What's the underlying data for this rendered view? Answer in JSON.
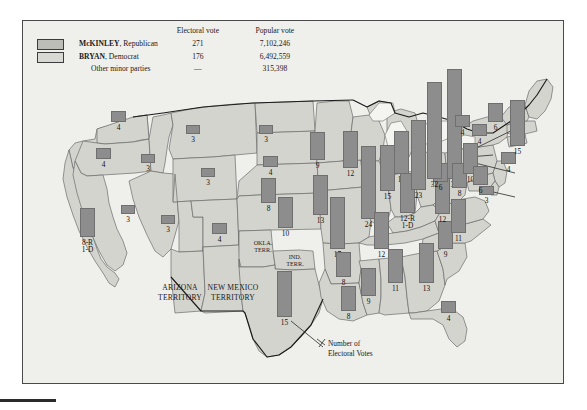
{
  "figure": {
    "title_hidden": "",
    "annotation": "Number of\nElectoral Votes"
  },
  "legend": {
    "headers": {
      "blank": "",
      "electoral": "Electoral vote",
      "popular": "Popular vote"
    },
    "rows": [
      {
        "swatch": "rep-swatch",
        "name": "McKINLEY",
        "party": ", Republican",
        "electoral": "271",
        "popular": "7,102,246"
      },
      {
        "swatch": "dem-swatch",
        "name": "BRYAN",
        "party": ", Democrat",
        "electoral": "176",
        "popular": "6,492,559"
      },
      {
        "swatch": "none",
        "name": "Other minor parties",
        "party": "",
        "electoral": "—",
        "popular": "315,398"
      }
    ]
  },
  "territories": [
    {
      "label": "ARIZONA\nTERRITORY"
    },
    {
      "label": "NEW MEXICO\nTERRITORY"
    },
    {
      "label": "OKLA.\nTERR."
    },
    {
      "label": "IND.\nTERR."
    }
  ],
  "colors": {
    "bar": "#8d8d8d",
    "bar_stroke": "#6f6f6f",
    "state_fill": "#d4d4cf",
    "lake_fill": "#f4f4f1",
    "page_bg": "#efefec",
    "frame": "#4a4a4a",
    "rep_swatch": "#bdbdb8",
    "dem_swatch": "#d9d9d4"
  },
  "chart_data": {
    "type": "bar",
    "xlabel": "",
    "ylabel": "Electoral votes",
    "ylim": [
      0,
      36
    ],
    "grid": false,
    "legend_position": "top-left",
    "note": "Bar height is proportional to the number of electoral votes; bars are drawn on a US map at each state's location.",
    "categories": [
      "WA",
      "OR",
      "CA",
      "NV",
      "ID",
      "MT",
      "WY",
      "UT",
      "CO",
      "ND",
      "SD",
      "NE",
      "KS",
      "TX",
      "MN",
      "IA",
      "MO",
      "AR",
      "LA",
      "WI",
      "IL",
      "MI",
      "IN",
      "KY",
      "TN",
      "MS",
      "AL",
      "GA",
      "FL",
      "SC",
      "NC",
      "VA",
      "WV",
      "OH",
      "PA",
      "NY",
      "MD",
      "DE",
      "NJ",
      "CT",
      "RI",
      "MA",
      "VT",
      "NH",
      "ME"
    ],
    "values": [
      4,
      4,
      9,
      3,
      3,
      3,
      3,
      3,
      4,
      3,
      4,
      8,
      10,
      15,
      9,
      13,
      17,
      8,
      8,
      12,
      24,
      14,
      15,
      13,
      12,
      9,
      11,
      13,
      4,
      9,
      11,
      12,
      6,
      23,
      32,
      36,
      8,
      3,
      10,
      6,
      4,
      15,
      4,
      4,
      6
    ],
    "labels": [
      "4",
      "4",
      "8-R\n1-D",
      "3",
      "3",
      "3",
      "3",
      "3",
      "4",
      "3",
      "4",
      "8",
      "10",
      "15",
      "9",
      "13",
      "17",
      "8",
      "8",
      "12",
      "24",
      "14",
      "15",
      "12-R\n1-D",
      "12",
      "9",
      "11",
      "13",
      "4",
      "9",
      "11",
      "12",
      "6",
      "23",
      "32",
      "36",
      "8",
      "3",
      "10",
      "6",
      "4",
      "15",
      "4",
      "4",
      "6"
    ],
    "states": [
      {
        "code": "WA",
        "name": "Washington",
        "votes": 4,
        "label": "4",
        "x": 88,
        "y": 90,
        "w": 15,
        "h": 11
      },
      {
        "code": "OR",
        "name": "Oregon",
        "votes": 4,
        "label": "4",
        "x": 73,
        "y": 127,
        "w": 15,
        "h": 11
      },
      {
        "code": "CA",
        "name": "California",
        "votes": 9,
        "label": "8-R\n1-D",
        "x": 57,
        "y": 187,
        "w": 15,
        "h": 29
      },
      {
        "code": "NV",
        "name": "Nevada",
        "votes": 3,
        "label": "3",
        "x": 98,
        "y": 184,
        "w": 14,
        "h": 9
      },
      {
        "code": "ID",
        "name": "Idaho",
        "votes": 3,
        "label": "3",
        "x": 118,
        "y": 133,
        "w": 14,
        "h": 9
      },
      {
        "code": "MT",
        "name": "Montana",
        "votes": 3,
        "label": "3",
        "x": 163,
        "y": 104,
        "w": 14,
        "h": 9
      },
      {
        "code": "WY",
        "name": "Wyoming",
        "votes": 3,
        "label": "3",
        "x": 178,
        "y": 147,
        "w": 14,
        "h": 9
      },
      {
        "code": "UT",
        "name": "Utah",
        "votes": 3,
        "label": "3",
        "x": 138,
        "y": 194,
        "w": 14,
        "h": 9
      },
      {
        "code": "CO",
        "name": "Colorado",
        "votes": 4,
        "label": "4",
        "x": 189,
        "y": 202,
        "w": 15,
        "h": 11
      },
      {
        "code": "ND",
        "name": "North Dakota",
        "votes": 3,
        "label": "3",
        "x": 236,
        "y": 104,
        "w": 14,
        "h": 9
      },
      {
        "code": "SD",
        "name": "South Dakota",
        "votes": 4,
        "label": "4",
        "x": 240,
        "y": 135,
        "w": 15,
        "h": 11
      },
      {
        "code": "NE",
        "name": "Nebraska",
        "votes": 8,
        "label": "8",
        "x": 238,
        "y": 157,
        "w": 15,
        "h": 25
      },
      {
        "code": "KS",
        "name": "Kansas",
        "votes": 10,
        "label": "10",
        "x": 255,
        "y": 176,
        "w": 15,
        "h": 31
      },
      {
        "code": "TX",
        "name": "Texas",
        "votes": 15,
        "label": "15",
        "x": 254,
        "y": 250,
        "w": 15,
        "h": 46
      },
      {
        "code": "MN",
        "name": "Minnesota",
        "votes": 9,
        "label": "9",
        "x": 287,
        "y": 111,
        "w": 15,
        "h": 28
      },
      {
        "code": "IA",
        "name": "Iowa",
        "votes": 13,
        "label": "13",
        "x": 290,
        "y": 154,
        "w": 15,
        "h": 40
      },
      {
        "code": "MO",
        "name": "Missouri",
        "votes": 17,
        "label": "17",
        "x": 307,
        "y": 176,
        "w": 15,
        "h": 52
      },
      {
        "code": "AR",
        "name": "Arkansas",
        "votes": 8,
        "label": "8",
        "x": 313,
        "y": 231,
        "w": 15,
        "h": 25
      },
      {
        "code": "LA",
        "name": "Louisiana",
        "votes": 8,
        "label": "8",
        "x": 318,
        "y": 265,
        "w": 15,
        "h": 25
      },
      {
        "code": "WI",
        "name": "Wisconsin",
        "votes": 12,
        "label": "12",
        "x": 320,
        "y": 110,
        "w": 15,
        "h": 37
      },
      {
        "code": "IL",
        "name": "Illinois",
        "votes": 24,
        "label": "24",
        "x": 338,
        "y": 125,
        "w": 15,
        "h": 73
      },
      {
        "code": "MI",
        "name": "Michigan",
        "votes": 14,
        "label": "14",
        "x": 371,
        "y": 110,
        "w": 15,
        "h": 43
      },
      {
        "code": "IN",
        "name": "Indiana",
        "votes": 15,
        "label": "15",
        "x": 357,
        "y": 124,
        "w": 15,
        "h": 46
      },
      {
        "code": "KY",
        "name": "Kentucky",
        "votes": 13,
        "label": "12-R\n1-D",
        "x": 377,
        "y": 152,
        "w": 15,
        "h": 40
      },
      {
        "code": "TN",
        "name": "Tennessee",
        "votes": 12,
        "label": "12",
        "x": 351,
        "y": 191,
        "w": 15,
        "h": 37
      },
      {
        "code": "MS",
        "name": "Mississippi",
        "votes": 9,
        "label": "9",
        "x": 338,
        "y": 247,
        "w": 15,
        "h": 28
      },
      {
        "code": "AL",
        "name": "Alabama",
        "votes": 11,
        "label": "11",
        "x": 365,
        "y": 228,
        "w": 15,
        "h": 34
      },
      {
        "code": "GA",
        "name": "Georgia",
        "votes": 13,
        "label": "13",
        "x": 396,
        "y": 222,
        "w": 15,
        "h": 40
      },
      {
        "code": "FL",
        "name": "Florida",
        "votes": 4,
        "label": "4",
        "x": 418,
        "y": 280,
        "w": 15,
        "h": 12
      },
      {
        "code": "SC",
        "name": "South Carolina",
        "votes": 9,
        "label": "9",
        "x": 415,
        "y": 200,
        "w": 15,
        "h": 28
      },
      {
        "code": "NC",
        "name": "North Carolina",
        "votes": 11,
        "label": "11",
        "x": 428,
        "y": 178,
        "w": 15,
        "h": 34
      },
      {
        "code": "VA",
        "name": "Virginia",
        "votes": 12,
        "label": "12",
        "x": 412,
        "y": 156,
        "w": 15,
        "h": 37
      },
      {
        "code": "WV",
        "name": "West Virginia",
        "votes": 6,
        "label": "6",
        "x": 410,
        "y": 142,
        "w": 15,
        "h": 19
      },
      {
        "code": "OH",
        "name": "Ohio",
        "votes": 23,
        "label": "23",
        "x": 388,
        "y": 99,
        "w": 15,
        "h": 70
      },
      {
        "code": "PA",
        "name": "Pennsylvania",
        "votes": 32,
        "label": "32",
        "x": 404,
        "y": 61,
        "w": 15,
        "h": 97
      },
      {
        "code": "NY",
        "name": "New York",
        "votes": 36,
        "label": "36",
        "x": 424,
        "y": 48,
        "w": 15,
        "h": 110
      },
      {
        "code": "MD",
        "name": "Maryland",
        "votes": 8,
        "label": "8",
        "x": 429,
        "y": 142,
        "w": 15,
        "h": 25
      },
      {
        "code": "DE",
        "name": "Delaware",
        "votes": 3,
        "label": "3",
        "x": 456,
        "y": 165,
        "w": 15,
        "h": 9
      },
      {
        "code": "NJ",
        "name": "New Jersey",
        "votes": 10,
        "label": "10",
        "x": 440,
        "y": 122,
        "w": 15,
        "h": 31
      },
      {
        "code": "CT",
        "name": "Connecticut",
        "votes": 6,
        "label": "6",
        "x": 450,
        "y": 145,
        "w": 15,
        "h": 19
      },
      {
        "code": "RI",
        "name": "Rhode Island",
        "votes": 4,
        "label": "4",
        "x": 478,
        "y": 131,
        "w": 15,
        "h": 12
      },
      {
        "code": "MA",
        "name": "Massachusetts",
        "votes": 15,
        "label": "15",
        "x": 487,
        "y": 79,
        "w": 15,
        "h": 46
      },
      {
        "code": "VT",
        "name": "Vermont",
        "votes": 4,
        "label": "4",
        "x": 432,
        "y": 94,
        "w": 15,
        "h": 12
      },
      {
        "code": "NH",
        "name": "New Hampshire",
        "votes": 4,
        "label": "4",
        "x": 449,
        "y": 103,
        "w": 15,
        "h": 12
      },
      {
        "code": "ME",
        "name": "Maine",
        "votes": 6,
        "label": "6",
        "x": 465,
        "y": 82,
        "w": 15,
        "h": 19
      }
    ]
  }
}
